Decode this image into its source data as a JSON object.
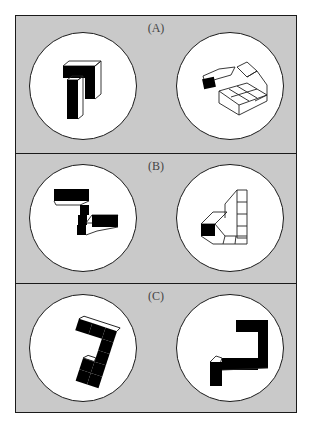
{
  "figure": {
    "background_color": "#c9c9c9",
    "circle_fill": "#ffffff",
    "border_color": "#1a1a1a",
    "panels": [
      {
        "label": "(A)",
        "items": [
          {
            "name": "left-cube-figure"
          },
          {
            "name": "right-cube-figure"
          }
        ]
      },
      {
        "label": "(B)",
        "items": [
          {
            "name": "left-cube-figure"
          },
          {
            "name": "right-cube-figure"
          }
        ]
      },
      {
        "label": "(C)",
        "items": [
          {
            "name": "left-cube-figure"
          },
          {
            "name": "right-cube-figure"
          }
        ]
      }
    ]
  }
}
